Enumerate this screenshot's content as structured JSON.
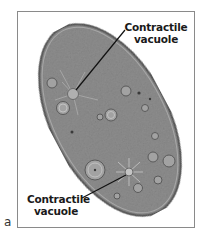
{
  "figure": {
    "panel_letter": "a",
    "labels": [
      {
        "id": "top",
        "line1": "Contractile",
        "line2": "vacuole"
      },
      {
        "id": "bottom",
        "line1": "Contractile",
        "line2": "vacuole"
      }
    ],
    "colors": {
      "cell_fill": "#8f8f8f",
      "cell_edge": "#5e5e5e",
      "frame": "#8a8a8a",
      "leader_line": "#111111",
      "label_text": "#1a1a1a"
    }
  }
}
